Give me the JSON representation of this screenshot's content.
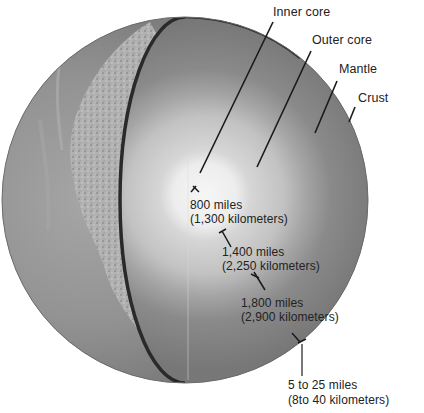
{
  "diagram": {
    "layers": [
      {
        "id": "inner-core",
        "label": "Inner core"
      },
      {
        "id": "outer-core",
        "label": "Outer core"
      },
      {
        "id": "mantle",
        "label": "Mantle"
      },
      {
        "id": "crust",
        "label": "Crust"
      }
    ],
    "measurements": [
      {
        "id": "inner-core-radius",
        "miles": "800 miles",
        "km": "(1,300 kilometers)"
      },
      {
        "id": "outer-core-thickness",
        "miles": "1,400 miles",
        "km": "(2,250 kilometers)"
      },
      {
        "id": "mantle-thickness",
        "miles": "1,800 miles",
        "km": "(2,900 kilometers)"
      },
      {
        "id": "crust-thickness",
        "miles": "5 to 25 miles",
        "km": "(8to 40 kilometers)"
      }
    ],
    "colors": {
      "background": "#ffffff",
      "surface": "#8e8e8e",
      "continent": "#b4b4b4",
      "mantle": "#7c7c7c",
      "outer_core": "#bdbdbd",
      "inner_core": "#f4f4f4",
      "edge": "#2a2a2a",
      "leader_line": "#1a1a1a",
      "text": "#222222"
    }
  }
}
